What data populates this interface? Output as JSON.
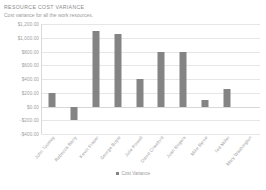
{
  "report": {
    "title": "RESOURCE COST VARIANCE",
    "subtitle": "Cost variance for all the work resources."
  },
  "chart_data": {
    "type": "bar",
    "title": "",
    "xlabel": "",
    "ylabel": "",
    "ylim": [
      -400,
      1200
    ],
    "ytick_labels": [
      "$1,200.00",
      "$1,000.00",
      "$800.00",
      "$600.00",
      "$400.00",
      "$200.00",
      "$0.00",
      "-$200.00",
      "-$400.00"
    ],
    "ytick_values": [
      1200,
      1000,
      800,
      600,
      400,
      200,
      0,
      -200,
      -400
    ],
    "grid": true,
    "legend_position": "bottom",
    "legend": [
      "Cost Variance"
    ],
    "categories": [
      "John Toomey",
      "Rebecca Barry",
      "Kevin Fraser",
      "George Boyle",
      "Julie Powell",
      "David Crawford",
      "Joan Rogers",
      "Mike Byrne",
      "Ted Miller",
      "Mary Washington"
    ],
    "series": [
      {
        "name": "Cost Variance",
        "color": "#848484",
        "values": [
          200,
          -200,
          1100,
          1050,
          400,
          800,
          800,
          100,
          250,
          0
        ]
      }
    ]
  }
}
